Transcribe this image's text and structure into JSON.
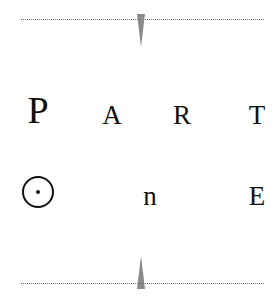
{
  "title_block": {
    "word1": {
      "letters": [
        "P",
        "A",
        "R",
        "T"
      ]
    },
    "word2": {
      "letters": [
        "O",
        "n",
        "E"
      ]
    }
  },
  "decorations": {
    "top_rule": "dotted-line",
    "bottom_rule": "dotted-line",
    "ornament_color": "#8a8a8a"
  }
}
